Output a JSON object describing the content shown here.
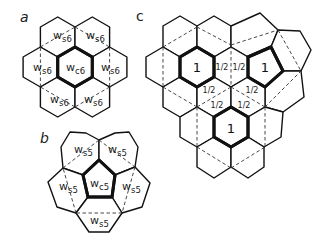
{
  "figure": {
    "panels": [
      {
        "id": "a",
        "label": "a",
        "label_pos": [
          20,
          22
        ],
        "cells": [
          {
            "name": "center",
            "points": "75,47 92.3,57 92.3,77 75,87 57.7,77 57.7,57",
            "bold": true
          },
          {
            "name": "top-left",
            "points": "57.7,17 75,27 75,47 57.7,57 40.4,47 40.4,27",
            "bold": false
          },
          {
            "name": "top-right",
            "points": "92.3,17 109.6,27 109.6,47 92.3,57 75,47 75,27",
            "bold": false
          },
          {
            "name": "left",
            "points": "40.4,47 57.7,57 57.7,77 40.4,87 23.1,77 23.1,57",
            "bold": false
          },
          {
            "name": "right",
            "points": "109.6,47 126.9,57 126.9,77 109.6,87 92.3,77 92.3,57",
            "bold": false
          },
          {
            "name": "bottom-left",
            "points": "57.7,77 75,87 75,107 57.7,117 40.4,107 40.4,87",
            "bold": false
          },
          {
            "name": "bottom-right",
            "points": "92.3,77 109.6,87 109.6,107 92.3,117 75,107 75,87",
            "bold": false
          }
        ],
        "dashed": [
          [
            40.4,
            47,
            75,
            27
          ],
          [
            75,
            27,
            109.6,
            47
          ],
          [
            109.6,
            47,
            109.6,
            87
          ],
          [
            109.6,
            87,
            75,
            107
          ],
          [
            75,
            107,
            40.4,
            87
          ],
          [
            40.4,
            87,
            40.4,
            47
          ]
        ],
        "labels": [
          {
            "main": "w",
            "sub": "s6",
            "x": 53,
            "y": 39
          },
          {
            "main": "w",
            "sub": "s6",
            "x": 86,
            "y": 39
          },
          {
            "main": "w",
            "sub": "s6",
            "x": 33,
            "y": 71
          },
          {
            "main": "w",
            "sub": "c6",
            "x": 66,
            "y": 71
          },
          {
            "main": "w",
            "sub": "s6",
            "x": 101,
            "y": 71
          },
          {
            "main": "w",
            "sub": "s6",
            "x": 50,
            "y": 103
          },
          {
            "main": "w",
            "sub": "s6",
            "x": 84,
            "y": 103
          }
        ]
      },
      {
        "id": "b",
        "label": "b",
        "label_pos": [
          40,
          143
        ],
        "cells": [
          {
            "name": "center-pentagon",
            "points": "99,160 115,175 112,197 88,197 83,175",
            "bold": true
          },
          {
            "name": "top-left",
            "points": "61,147 70,132 86,133 99,140 99,160 83,175 63,168",
            "bold": false
          },
          {
            "name": "top-right",
            "points": "99,140 115,133 129,132 138,147 135,167 115,175 99,160",
            "bold": false
          },
          {
            "name": "left",
            "points": "63,168 83,175 88,197 76,213 57,207 48,182",
            "bold": false
          },
          {
            "name": "right",
            "points": "135,167 150,183 142,207 122,213 112,197 115,175",
            "bold": false
          },
          {
            "name": "bottom",
            "points": "88,197 112,197 122,213 109,232 89,232 76,213",
            "bold": false
          }
        ],
        "dashed": [
          [
            63,
            168,
            99,
            140
          ],
          [
            99,
            140,
            135,
            167
          ],
          [
            135,
            167,
            122,
            213
          ],
          [
            122,
            213,
            76,
            213
          ],
          [
            76,
            213,
            63,
            168
          ]
        ],
        "labels": [
          {
            "main": "w",
            "sub": "s5",
            "x": 74,
            "y": 153
          },
          {
            "main": "w",
            "sub": "s5",
            "x": 108,
            "y": 153
          },
          {
            "main": "w",
            "sub": "s5",
            "x": 59,
            "y": 190
          },
          {
            "main": "w",
            "sub": "c5",
            "x": 90,
            "y": 187
          },
          {
            "main": "w",
            "sub": "s5",
            "x": 122,
            "y": 190
          },
          {
            "main": "w",
            "sub": "s5",
            "x": 90,
            "y": 224
          }
        ]
      },
      {
        "id": "c",
        "label": "c",
        "label_pos": [
          136,
          21
        ],
        "cells": [
          {
            "name": "row0-a",
            "points": "180,16 197,26 197,47 180,57 163,47 163,26",
            "bold": false
          },
          {
            "name": "row0-b",
            "points": "214,16 231,26 231,47 214,57 197,47 197,26",
            "bold": false
          },
          {
            "name": "top-irregular",
            "points": "231,26 260,13 278,30 271,47 248,57 231,47",
            "bold": false
          },
          {
            "name": "right-upper-irregular",
            "points": "271,47 278,30 300,31 311,50 301,71 283,71",
            "bold": false
          },
          {
            "name": "row1-left",
            "points": "163,47 180,57 180,77 163,87 146,77 146,57",
            "bold": false
          },
          {
            "name": "row1-half",
            "points": "231,47 248,57 248,77 231,87 214,77 214,57",
            "bold": false
          },
          {
            "name": "right-mid-irregular",
            "points": "265,87 283,71 301,71 304,97 283,112 265,107",
            "bold": false
          },
          {
            "name": "row2-a",
            "points": "180,77 197,87 197,107 180,117 163,107 163,87",
            "bold": false
          },
          {
            "name": "row2-b",
            "points": "214,77 231,87 231,107 214,117 197,107 197,87",
            "bold": false
          },
          {
            "name": "row2-c",
            "points": "248,77 265,87 265,107 248,117 231,107 231,87",
            "bold": false
          },
          {
            "name": "row3-left",
            "points": "197,107 214,117 214,137 197,147 180,137 180,117",
            "bold": false
          },
          {
            "name": "row3-right",
            "points": "248,117 265,107 283,112 281,137 264,147 248,137",
            "bold": false
          },
          {
            "name": "row4-a",
            "points": "214,137 231,147 231,167 214,178 197,167 197,147",
            "bold": false
          },
          {
            "name": "row4-b",
            "points": "248,137 264,147 264,167 248,178 231,167 231,147",
            "bold": false
          },
          {
            "name": "bold-hex-left",
            "points": "197,47 214,57 214,77 197,87 180,77 180,57",
            "bold": true
          },
          {
            "name": "bold-pentagon-right",
            "points": "248,57 271,47 283,71 265,87 248,77",
            "bold": true
          },
          {
            "name": "bold-hex-bottom",
            "points": "231,107 248,117 248,137 231,147 214,137 214,117",
            "bold": true
          }
        ],
        "dashed": [
          [
            163,
            47,
            197,
            27
          ],
          [
            197,
            27,
            231,
            45
          ],
          [
            231,
            45,
            278,
            30
          ],
          [
            278,
            30,
            301,
            71
          ],
          [
            163,
            47,
            163,
            87
          ],
          [
            231,
            45,
            231,
            87
          ],
          [
            163,
            87,
            197,
            107
          ],
          [
            197,
            107,
            231,
            87
          ],
          [
            231,
            87,
            265,
            107
          ],
          [
            265,
            107,
            301,
            71
          ],
          [
            197,
            107,
            197,
            147
          ],
          [
            265,
            107,
            265,
            147
          ],
          [
            197,
            147,
            231,
            168
          ],
          [
            231,
            168,
            265,
            147
          ]
        ],
        "ones": [
          {
            "text": "1",
            "x": 197,
            "y": 72
          },
          {
            "text": "1",
            "x": 265,
            "y": 72
          },
          {
            "text": "1",
            "x": 231,
            "y": 133
          }
        ],
        "halves": [
          {
            "text": "1/2",
            "x": 222,
            "y": 70
          },
          {
            "text": "1/2",
            "x": 239,
            "y": 70
          },
          {
            "text": "1/2",
            "x": 209,
            "y": 93
          },
          {
            "text": "1/2",
            "x": 252,
            "y": 93
          },
          {
            "text": "1/2",
            "x": 217,
            "y": 108
          },
          {
            "text": "1/2",
            "x": 244,
            "y": 108
          }
        ]
      }
    ]
  }
}
